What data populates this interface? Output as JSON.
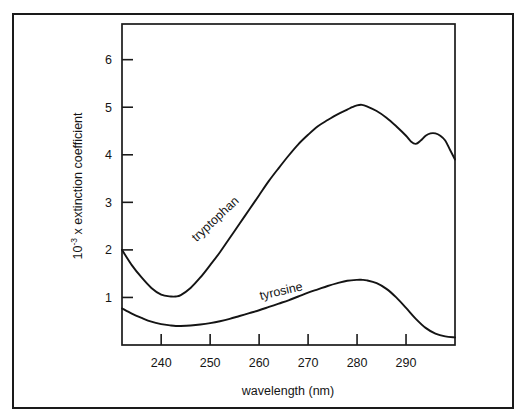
{
  "figure": {
    "y_axis_label_main": "x extinction coefficient",
    "y_axis_label_base": "10",
    "y_axis_label_exponent": "-3",
    "x_axis_label": "wavelength  (nm)",
    "caption_partial": ""
  },
  "chart_data": {
    "type": "line",
    "title": "",
    "xlabel": "wavelength  (nm)",
    "ylabel": "10^-3 x extinction coefficient",
    "xlim": [
      232,
      300
    ],
    "ylim": [
      0,
      6.75
    ],
    "xticks": [
      240,
      250,
      260,
      270,
      280,
      290
    ],
    "yticks": [
      1,
      2,
      3,
      4,
      5,
      6
    ],
    "xtick_labels": [
      "240",
      "250",
      "260",
      "270",
      "280",
      "290"
    ],
    "ytick_labels": [
      "1",
      "2",
      "3",
      "4",
      "5",
      "6"
    ],
    "grid": false,
    "legend_position": "inline-annotation",
    "series": [
      {
        "name": "tryptophan",
        "label": "tryptophan",
        "label_rotation_deg": -43,
        "x": [
          232,
          234,
          236,
          238,
          240,
          242,
          243,
          244,
          246,
          248,
          250,
          252,
          254,
          256,
          258,
          260,
          262,
          264,
          266,
          268,
          270,
          272,
          274,
          276,
          278,
          279,
          280,
          281,
          282,
          284,
          286,
          288,
          290,
          291,
          292,
          293,
          294,
          295,
          296,
          297,
          298,
          299,
          300
        ],
        "y": [
          2.0,
          1.68,
          1.42,
          1.2,
          1.06,
          1.02,
          1.02,
          1.05,
          1.2,
          1.42,
          1.68,
          1.95,
          2.25,
          2.55,
          2.85,
          3.15,
          3.45,
          3.72,
          3.98,
          4.22,
          4.42,
          4.6,
          4.73,
          4.85,
          4.95,
          5.0,
          5.04,
          5.05,
          5.02,
          4.92,
          4.78,
          4.6,
          4.4,
          4.28,
          4.23,
          4.3,
          4.4,
          4.45,
          4.45,
          4.4,
          4.3,
          4.1,
          3.9
        ]
      },
      {
        "name": "tyrosine",
        "label": "tyrosine",
        "label_rotation_deg": -13,
        "x": [
          232,
          234,
          236,
          238,
          240,
          242,
          243,
          244,
          246,
          248,
          250,
          252,
          254,
          256,
          258,
          260,
          262,
          264,
          266,
          268,
          270,
          272,
          274,
          276,
          278,
          280,
          281,
          282,
          284,
          286,
          288,
          290,
          292,
          294,
          296,
          298,
          300
        ],
        "y": [
          0.77,
          0.66,
          0.57,
          0.49,
          0.44,
          0.41,
          0.4,
          0.4,
          0.41,
          0.43,
          0.46,
          0.5,
          0.55,
          0.61,
          0.67,
          0.73,
          0.8,
          0.87,
          0.94,
          1.02,
          1.1,
          1.17,
          1.24,
          1.3,
          1.35,
          1.37,
          1.37,
          1.36,
          1.3,
          1.18,
          1.0,
          0.78,
          0.55,
          0.36,
          0.24,
          0.18,
          0.16
        ]
      }
    ]
  }
}
